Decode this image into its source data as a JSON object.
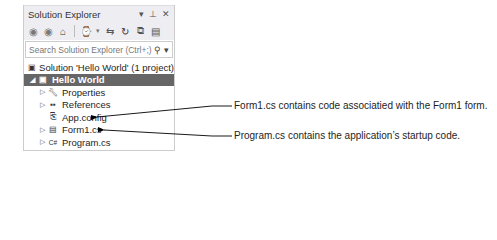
{
  "panel": {
    "title": "Solution Explorer",
    "title_controls": [
      "▾",
      "⊥",
      "✕"
    ],
    "toolbar_icons": [
      "back-icon",
      "forward-icon",
      "home-icon",
      "history-icon",
      "sync-icon",
      "refresh-icon",
      "collapse-all-icon",
      "show-all-files-icon"
    ],
    "search": {
      "placeholder": "Search Solution Explorer (Ctrl+;)",
      "icon": "search-icon"
    }
  },
  "tree": {
    "items": [
      {
        "label": "Solution 'Hello World' (1 project)",
        "icon": "solution-icon",
        "indent": 0,
        "expander": "",
        "selected": false
      },
      {
        "label": "Hello World",
        "icon": "project-icon",
        "indent": 0,
        "expander": "◢",
        "selected": true
      },
      {
        "label": "Properties",
        "icon": "wrench-icon",
        "indent": 1,
        "expander": "▷",
        "selected": false
      },
      {
        "label": "References",
        "icon": "references-icon",
        "indent": 1,
        "expander": "▷",
        "selected": false
      },
      {
        "label": "App.config",
        "icon": "config-icon",
        "indent": 1,
        "expander": "",
        "selected": false
      },
      {
        "label": "Form1.cs",
        "icon": "form-icon",
        "indent": 1,
        "expander": "▷",
        "selected": false
      },
      {
        "label": "Program.cs",
        "icon": "csharp-icon",
        "indent": 1,
        "expander": "▷",
        "selected": false
      }
    ]
  },
  "callouts": {
    "form1": "Form1.cs contains code associatied with the Form1 form.",
    "program": "Program.cs contains the application’s startup code."
  }
}
